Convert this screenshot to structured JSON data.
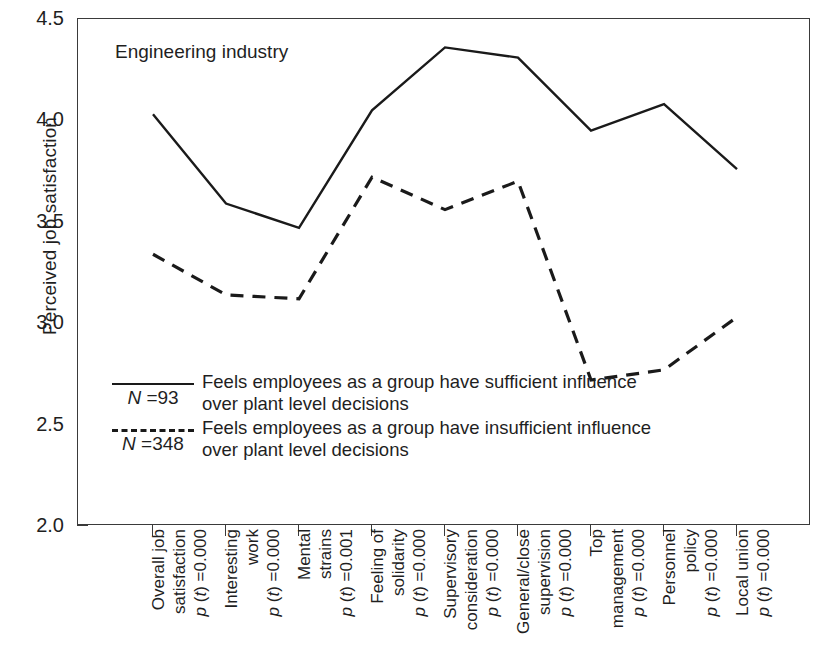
{
  "chart_data": {
    "type": "line",
    "title": "Engineering industry",
    "xlabel": "",
    "ylabel": "Perceived job satisfaction",
    "ylim": [
      2.0,
      4.5
    ],
    "yticks": [
      "4.5",
      "4.0",
      "3.5",
      "3.0",
      "2.5",
      "2.0"
    ],
    "ytick_values": [
      4.5,
      4.0,
      3.5,
      3.0,
      2.5,
      2.0
    ],
    "grid": false,
    "legend_position": "inside-lower-left",
    "categories": [
      "Overall job satisfaction",
      "Interesting work",
      "Mental strains",
      "Feeling of solidarity",
      "Supervisory consideration",
      "General/close supervision",
      "Top management",
      "Personnel policy",
      "Local union"
    ],
    "category_labels": [
      {
        "line1": "Overall job",
        "line2": "satisfaction",
        "p_value": "0.000"
      },
      {
        "line1": "Interesting",
        "line2": "work",
        "p_value": "0.000"
      },
      {
        "line1": "Mental",
        "line2": "strains",
        "p_value": "0.001"
      },
      {
        "line1": "Feeling of",
        "line2": "solidarity",
        "p_value": "0.000"
      },
      {
        "line1": "Supervisory",
        "line2": "consideration",
        "p_value": "0.000"
      },
      {
        "line1": "General/close",
        "line2": "supervision",
        "p_value": "0.000"
      },
      {
        "line1": "Top",
        "line2": "management",
        "p_value": "0.000"
      },
      {
        "line1": "Personnel",
        "line2": "policy",
        "p_value": "0.000"
      },
      {
        "line1": "Local union",
        "line2": "",
        "p_value": "0.000"
      }
    ],
    "series": [
      {
        "name": "sufficient-influence",
        "style": "solid",
        "n": "93",
        "n_label": "N =93",
        "legend_line1": "Feels employees as a group have sufficient influence",
        "legend_line2": "over plant level decisions",
        "values": [
          4.03,
          3.59,
          3.47,
          4.05,
          4.36,
          4.31,
          3.95,
          4.08,
          3.76
        ]
      },
      {
        "name": "insufficient-influence",
        "style": "dashed",
        "n": "348",
        "n_label": "N =348",
        "legend_line1": "Feels employees as a group have insufficient influence",
        "legend_line2": "over plant level decisions",
        "values": [
          3.34,
          3.14,
          3.12,
          3.72,
          3.56,
          3.7,
          2.72,
          2.77,
          3.03
        ]
      }
    ],
    "colors": {
      "line": "#1a1a1a",
      "axis": "#3a3a3a",
      "text": "#1f1f1f",
      "background": "#ffffff"
    }
  }
}
